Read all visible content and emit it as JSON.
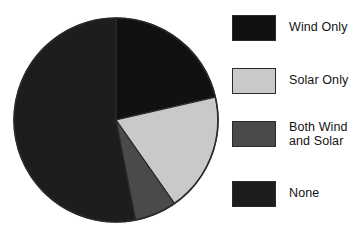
{
  "chart_data": {
    "type": "pie",
    "title": "",
    "subtitle": "",
    "xlabel": "",
    "ylabel": "",
    "grid": false,
    "legend_position": "right",
    "start_angle_deg": 0,
    "direction": "clockwise",
    "categories": [
      "Wind Only",
      "Solar Only",
      "Both Wind and Solar",
      "None"
    ],
    "values": [
      21.5,
      19.0,
      6.5,
      53.0
    ],
    "units": "percent",
    "slices": [
      {
        "label": "Wind Only",
        "value": 21.5,
        "angle_deg": 77,
        "color": "#111111",
        "swatch_color": "#111111"
      },
      {
        "label": "Solar Only",
        "value": 19.0,
        "angle_deg": 68,
        "color": "#c9c9c9",
        "swatch_color": "#c9c9c9"
      },
      {
        "label": "Both Wind and Solar",
        "value": 6.5,
        "angle_deg": 24,
        "color": "#4a4a4a",
        "swatch_color": "#4a4a4a"
      },
      {
        "label": "None",
        "value": 53.0,
        "angle_deg": 191,
        "color": "#1d1d1d",
        "swatch_color": "#1d1d1d"
      }
    ],
    "geometry": {
      "center_x": 116,
      "center_y": 120,
      "radius": 102,
      "outline_color": "#2b2b2b"
    }
  },
  "legend": {
    "items": [
      {
        "label": "Wind Only",
        "color": "#111111"
      },
      {
        "label": "Solar Only",
        "color": "#c9c9c9"
      },
      {
        "label": "Both Wind\nand Solar",
        "color": "#4a4a4a"
      },
      {
        "label": "None",
        "color": "#1d1d1d"
      }
    ]
  },
  "colors": {
    "background": "#ffffff",
    "text": "#141414",
    "outline": "#2b2b2b",
    "wind_only": "#111111",
    "solar_only": "#c9c9c9",
    "both_wind_and_solar": "#4a4a4a",
    "none": "#1d1d1d"
  }
}
